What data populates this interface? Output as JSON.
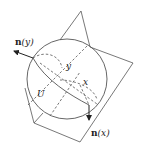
{
  "diagram": {
    "labels": {
      "n_y_fn": "n",
      "n_y_arg": "(y)",
      "n_x_fn": "n",
      "n_x_arg": "(x)",
      "y": "y",
      "x": "x",
      "U": "U"
    },
    "colors": {
      "stroke": "#444444",
      "background": "#ffffff"
    }
  }
}
